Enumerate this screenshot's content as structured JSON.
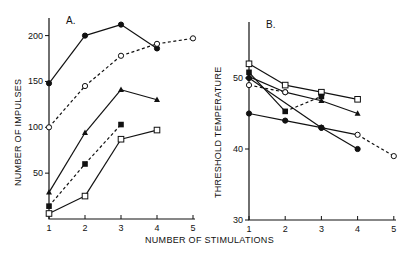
{
  "chart_data": [
    {
      "type": "line",
      "panel": "A.",
      "title": "A.",
      "xlabel": "NUMBER OF STIMULATIONS",
      "ylabel": "NUMBER OF IMPULSES",
      "x_ticks": [
        1,
        2,
        3,
        4,
        5
      ],
      "y_ticks": [
        50,
        100,
        150,
        200
      ],
      "xlim": [
        1,
        5
      ],
      "ylim": [
        0,
        220
      ],
      "grid": false,
      "legend": null,
      "series": [
        {
          "name": "filled-circle",
          "marker": "circle-filled",
          "style": "solid",
          "x": [
            1,
            2,
            3,
            4
          ],
          "values": [
            148,
            200,
            212,
            186
          ]
        },
        {
          "name": "open-circle",
          "marker": "circle-open",
          "style": "dashed",
          "x": [
            1,
            2,
            3,
            4,
            5
          ],
          "values": [
            100,
            145,
            178,
            191,
            197
          ]
        },
        {
          "name": "filled-triangle",
          "marker": "triangle-filled",
          "style": "solid",
          "x": [
            1,
            2,
            3,
            4
          ],
          "values": [
            29,
            94,
            141,
            130
          ]
        },
        {
          "name": "filled-square",
          "marker": "square-filled",
          "style": "dashdot",
          "x": [
            1,
            2,
            3
          ],
          "values": [
            14,
            60,
            103
          ]
        },
        {
          "name": "open-square",
          "marker": "square-open",
          "style": "solid",
          "x": [
            1,
            2,
            3,
            4
          ],
          "values": [
            6,
            25,
            87,
            97
          ]
        }
      ]
    },
    {
      "type": "line",
      "panel": "B.",
      "title": "B.",
      "xlabel": "NUMBER OF STIMULATIONS",
      "ylabel": "THRESHOLD TEMPERATURE",
      "x_ticks": [
        1,
        2,
        3,
        4,
        5
      ],
      "y_ticks": [
        30,
        40,
        50
      ],
      "xlim": [
        1,
        5
      ],
      "ylim": [
        30,
        56
      ],
      "grid": false,
      "legend": null,
      "series": [
        {
          "name": "open-square",
          "marker": "square-open",
          "style": "solid",
          "x": [
            1,
            2,
            3,
            4
          ],
          "values": [
            52,
            49,
            48,
            47
          ]
        },
        {
          "name": "filled-triangle",
          "marker": "triangle-filled",
          "style": "solid",
          "x": [
            1,
            2,
            3,
            4
          ],
          "values": [
            50.2,
            48,
            46.8,
            45
          ]
        },
        {
          "name": "filled-square",
          "marker": "square-filled",
          "style": "solid-then-dashed",
          "x": [
            1,
            2,
            3
          ],
          "values": [
            50.8,
            45.3,
            47.4
          ]
        },
        {
          "name": "open-circle-upper",
          "marker": "circle-open",
          "style": "dashed",
          "x": [
            1,
            2
          ],
          "values": [
            49,
            48
          ]
        },
        {
          "name": "filled-circle-steep",
          "marker": "circle-filled",
          "style": "solid",
          "x": [
            1,
            3,
            4
          ],
          "values": [
            50,
            43,
            40
          ]
        },
        {
          "name": "filled-circle-lower",
          "marker": "circle-filled",
          "style": "solid-then-dashed",
          "x": [
            1,
            2,
            3,
            4,
            5
          ],
          "values": [
            45,
            44,
            43,
            42,
            39
          ]
        }
      ]
    }
  ],
  "figure": {
    "panel_a_label": "A.",
    "panel_b_label": "B.",
    "panel_a_ylabel": "NUMBER OF IMPULSES",
    "panel_b_ylabel": "THRESHOLD TEMPERATURE",
    "shared_xlabel": "NUMBER OF STIMULATIONS"
  }
}
